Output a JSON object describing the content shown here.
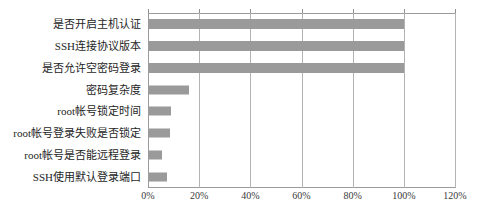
{
  "clipped_header_text": "— ———  —  — ————",
  "chart_data": {
    "type": "bar",
    "orientation": "horizontal",
    "title": "",
    "xlabel": "",
    "ylabel": "",
    "categories": [
      "是否开启主机认证",
      "SSH连接协议版本",
      "是否允许空密码登录",
      "密码复杂度",
      "root帐号锁定时间",
      "root帐号登录失败是否锁定",
      "root帐号是否能远程登录",
      "SSH使用默认登录端口"
    ],
    "values": [
      100,
      100,
      100,
      16,
      9,
      8.6,
      5.5,
      7.5
    ],
    "value_unit": "%",
    "xlim": [
      0,
      120
    ],
    "xticks": [
      0,
      20,
      40,
      60,
      80,
      100,
      120
    ],
    "xtick_labels": [
      "0%",
      "20%",
      "40%",
      "60%",
      "80%",
      "100%",
      "120%"
    ],
    "grid": "vertical",
    "legend": "none",
    "bar_color": "#9a9a9a",
    "axis_color": "#9b9b9b",
    "gridline_color": "#b3b3b3"
  }
}
